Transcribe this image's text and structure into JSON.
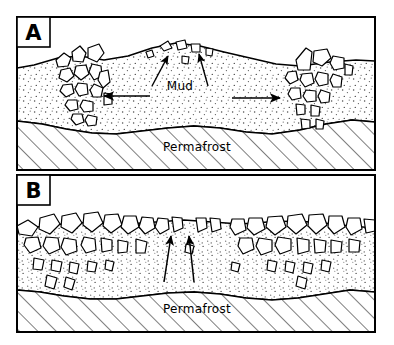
{
  "figure": {
    "type": "geological-cross-section-diagram",
    "background_color": "#ffffff",
    "line_color": "#000000",
    "width": 394,
    "height": 345
  },
  "panels": [
    {
      "id": "A",
      "letter": "A",
      "labels": [
        {
          "text": "Mud",
          "name": "mud-label"
        },
        {
          "text": "Permafrost",
          "name": "permafrost-label-a"
        }
      ],
      "arrows": {
        "mud_pointers": 2,
        "lateral_flow": [
          "left",
          "right"
        ]
      },
      "description_layers": [
        "mud-matrix-stipple",
        "clast-wedge-left",
        "clast-wedge-right",
        "permafrost-hatched"
      ]
    },
    {
      "id": "B",
      "letter": "B",
      "labels": [
        {
          "text": "Permafrost",
          "name": "permafrost-label-b"
        }
      ],
      "arrows": {
        "upward": 2
      },
      "description_layers": [
        "clast-pavement-surface",
        "mud-matrix-stipple",
        "permafrost-hatched"
      ]
    }
  ],
  "colors": {
    "ink": "#000000",
    "paper": "#ffffff",
    "stipple": "#555555"
  }
}
